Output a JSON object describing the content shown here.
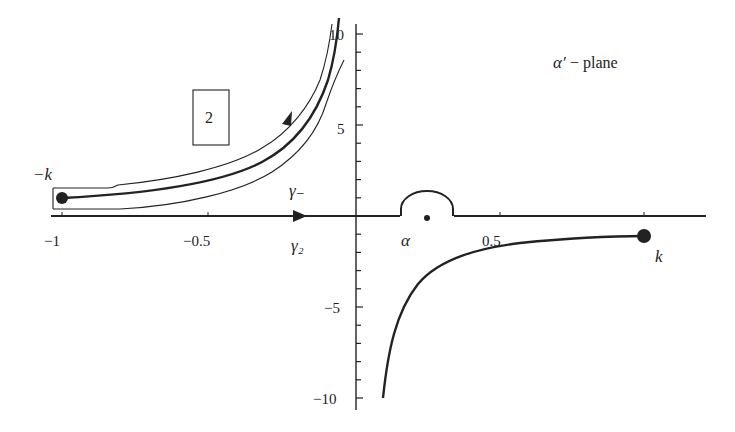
{
  "diagram": {
    "plane_label_symbol": "α′",
    "plane_label_text": " − plane",
    "region_label": "2",
    "point_labels": {
      "minus_k": "−k",
      "k": "k",
      "alpha": "α"
    },
    "contour_labels": {
      "gamma_minus": "γ₋",
      "gamma_2": "γ₂"
    },
    "x_ticks": [
      {
        "value": -1,
        "label": "−1"
      },
      {
        "value": -0.5,
        "label": "−0.5"
      },
      {
        "value": 0.5,
        "label": "0.5"
      }
    ],
    "y_ticks": [
      {
        "value": 10,
        "label": "10"
      },
      {
        "value": 5,
        "label": "5"
      },
      {
        "value": -5,
        "label": "−5"
      },
      {
        "value": -10,
        "label": "−10"
      }
    ],
    "colors": {
      "ink": "#222222",
      "background": "#ffffff"
    }
  }
}
